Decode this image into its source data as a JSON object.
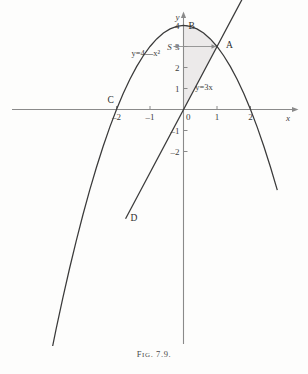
{
  "figure": {
    "caption_prefix": "F",
    "caption_small": "IG",
    "caption_number": ". 7.9."
  },
  "chart_data": {
    "type": "line",
    "title": "",
    "xlabel": "x",
    "ylabel": "y",
    "xlim": [
      -4.6,
      2.9
    ],
    "ylim": [
      -5.2,
      4.6
    ],
    "grid": false,
    "legend": "none",
    "series": [
      {
        "name": "parabola",
        "equation": "y=4—x²",
        "label_x": -1.55,
        "label_y": 2.55,
        "x": [
          -4.4,
          -4.2,
          -4.0,
          -3.8,
          -3.6,
          -3.4,
          -3.2,
          -3.0,
          -2.8,
          -2.6,
          -2.4,
          -2.2,
          -2.0,
          -1.8,
          -1.6,
          -1.4,
          -1.2,
          -1.0,
          -0.8,
          -0.6,
          -0.4,
          -0.2,
          0.0,
          0.2,
          0.4,
          0.6,
          0.8,
          1.0,
          1.2,
          1.4,
          1.6,
          1.8,
          2.0,
          2.2,
          2.4,
          2.6,
          2.8
        ],
        "y": [
          -15.36,
          -13.64,
          -12.0,
          -10.44,
          -8.96,
          -7.56,
          -6.24,
          -5.0,
          -3.84,
          -2.76,
          -1.76,
          -0.84,
          0.0,
          0.76,
          1.44,
          2.04,
          2.56,
          3.0,
          3.36,
          3.64,
          3.84,
          3.96,
          4.0,
          3.96,
          3.84,
          3.64,
          3.36,
          3.0,
          2.56,
          2.04,
          1.44,
          0.76,
          0.0,
          -0.84,
          -1.76,
          -2.76,
          -3.84
        ]
      },
      {
        "name": "straight-line",
        "equation": "y=3x",
        "label_x": 0.35,
        "label_y": 0.95,
        "x": [
          -1.73,
          2.0
        ],
        "y": [
          -5.2,
          6.0
        ]
      }
    ],
    "shaded_region": {
      "label": "S",
      "label_x": -0.42,
      "label_y": 3.0,
      "description": "area between parabola and line from x=0 to x=1"
    },
    "points": [
      {
        "name": "A",
        "x": 1.0,
        "y": 3.0,
        "label_dx": 9,
        "label_dy": 1
      },
      {
        "name": "B",
        "x": 0.0,
        "y": 4.0,
        "label_dx": 5,
        "label_dy": 3
      },
      {
        "name": "C",
        "x": -2.0,
        "y": 0.0,
        "label_dx": -9,
        "label_dy": -7
      },
      {
        "name": "D",
        "x": -1.73,
        "y": -5.2,
        "label_dx": 5,
        "label_dy": 2
      }
    ],
    "x_ticks": [
      {
        "value": -2,
        "label": "–2"
      },
      {
        "value": -1,
        "label": "–1"
      },
      {
        "value": 0,
        "label": "0"
      },
      {
        "value": 1,
        "label": "1"
      },
      {
        "value": 2,
        "label": "2"
      }
    ],
    "y_ticks": [
      {
        "value": 4,
        "label": "4"
      },
      {
        "value": 3,
        "label": "3"
      },
      {
        "value": 2,
        "label": "2"
      },
      {
        "value": 1,
        "label": "1"
      },
      {
        "value": -1,
        "label": "–1"
      },
      {
        "value": -2,
        "label": "–2"
      }
    ],
    "colors": {
      "curve": "#3a3a3a",
      "axis": "#8a8a8a",
      "shade": "#eceaea",
      "background": "#fdfdfc"
    }
  }
}
